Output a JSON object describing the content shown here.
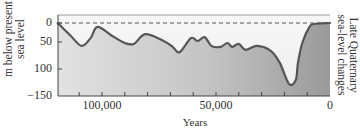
{
  "chart_data": {
    "type": "area",
    "title": "Late Quaternary sea-level changes",
    "xlabel": "Years",
    "ylabel": "m below present sea level",
    "x_reversed": true,
    "xlim": [
      120000,
      0
    ],
    "ylim": [
      150,
      0
    ],
    "xticks": [
      100000,
      50000,
      0
    ],
    "xtick_labels": [
      "100,000",
      "50,000",
      "0"
    ],
    "minor_xtick_step": 10000,
    "yticks": [
      0,
      50,
      100,
      150
    ],
    "ytick_labels": [
      "0",
      "50",
      "100",
      "−150"
    ],
    "reference_line": {
      "y": 0,
      "style": "dashed",
      "meaning": "present sea level"
    },
    "grid": false,
    "legend": null,
    "series": [
      {
        "name": "Sea level (m below present)",
        "x": [
          119000,
          114000,
          109000,
          105000,
          102000,
          96000,
          90000,
          86000,
          81000,
          73000,
          69000,
          66000,
          61000,
          58000,
          55000,
          52000,
          48000,
          45000,
          43000,
          40000,
          37000,
          32000,
          26000,
          22000,
          18000,
          15000,
          14000,
          12000,
          9000,
          7000,
          0
        ],
        "values": [
          2,
          25,
          47,
          31,
          8,
          25,
          41,
          43,
          23,
          37,
          49,
          60,
          31,
          37,
          29,
          47,
          49,
          41,
          49,
          43,
          55,
          47,
          57,
          82,
          125,
          117,
          80,
          39,
          8,
          2,
          0
        ]
      }
    ]
  },
  "labels": {
    "ylabel_line1": "m below present",
    "ylabel_line2": "sea level",
    "right_line1": "Late Quaternary",
    "right_line2": "sea-level changes",
    "xlabel": "Years",
    "ytick_0": "0",
    "ytick_50": "50",
    "ytick_100": "100",
    "ytick_150": "−150",
    "xtick_100000": "100,000",
    "xtick_50000": "50,000",
    "xtick_0": "0"
  },
  "colors": {
    "above_curve": "#f3f3f3",
    "fill_light": "#dedede",
    "fill_dark": "#9c9c9c",
    "curve": "#555555",
    "axis": "#444444",
    "dashed": "#555555"
  }
}
